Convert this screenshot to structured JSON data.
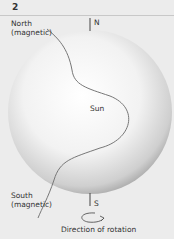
{
  "figure": {
    "number": "2",
    "labels": {
      "north_magnetic": [
        "North",
        "(magnetic)"
      ],
      "south_magnetic": [
        "South",
        "(magnetic)"
      ],
      "north_pole": "N",
      "south_pole": "S",
      "sun": "Sun",
      "rotation": "Direction of rotation"
    },
    "colors": {
      "background": "#ececec",
      "sphere_light": "#ffffff",
      "sphere_dark": "#9a9a9a",
      "field_line": "#777777",
      "text": "#333333"
    }
  }
}
